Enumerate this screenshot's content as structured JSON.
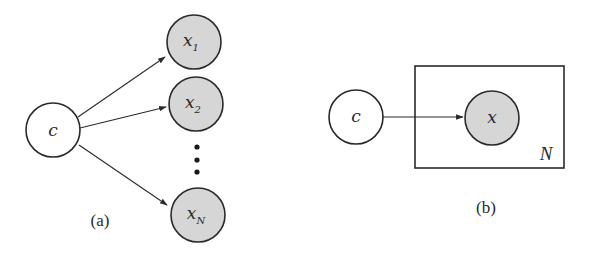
{
  "panel_a": {
    "caption": "(a)",
    "root_node": {
      "label": "c",
      "type": "latent"
    },
    "child_nodes": [
      {
        "var": "x",
        "sub": "1",
        "type": "observed"
      },
      {
        "var": "x",
        "sub": "2",
        "type": "observed"
      },
      {
        "var": "x",
        "sub": "N",
        "type": "observed"
      }
    ],
    "ellipsis": "vertical-dots"
  },
  "panel_b": {
    "caption": "(b)",
    "root_node": {
      "label": "c",
      "type": "latent"
    },
    "child_node": {
      "label": "x",
      "type": "observed"
    },
    "plate_label": "N"
  },
  "colors": {
    "stroke": "#2a2a2a",
    "observed_fill": "#d6d6d6",
    "latent_fill": "#ffffff"
  }
}
